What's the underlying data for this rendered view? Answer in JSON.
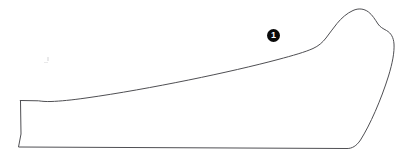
{
  "figure": {
    "type": "line-drawing-outline",
    "background_color": "#ffffff",
    "stroke_color": "#4f4f53",
    "stroke_width": 1,
    "width": 417,
    "height": 163,
    "outline_path": "M 20.5 100.5 L 21.0 134.0 L 18.5 147.0 L 347.0 148.5 C 352.0 148.6 356.5 146.0 360.5 140.0 C 370.0 125.0 381.0 100.0 388.5 76.0 C 392.5 63.0 394.5 52.0 394.0 44.0 C 393.6 37.5 391.0 33.0 386.5 30.5 C 383.0 28.6 380.0 27.0 378.0 24.0 C 375.0 19.5 372.5 15.0 368.5 12.0 C 364.0 8.6 358.5 8.0 353.0 10.5 C 347.0 13.2 341.5 18.0 337.0 23.5 C 333.0 28.4 329.5 33.5 326.0 38.0 C 322.5 42.5 318.5 46.0 313.0 48.5 C 305.0 52.1 293.0 55.5 278.0 59.5 C 232.0 71.8 150.0 89.0 86.0 98.0 C 72.0 100.0 60.0 101.2 51.0 101.5 C 45.5 101.7 42.0 101.3 38.5 100.8 L 20.5 100.5 Z"
  },
  "callouts": [
    {
      "label": "1",
      "x": 267,
      "y": 29,
      "marker_style": "filled-circle-white-number",
      "marker_color": "#0a0a0a",
      "text_color": "#ffffff"
    }
  ]
}
